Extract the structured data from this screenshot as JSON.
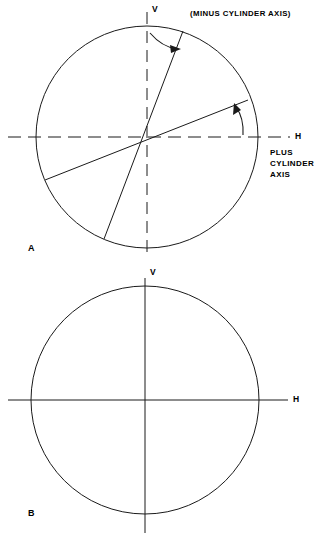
{
  "figure": {
    "stroke_color": "#1a1a1a",
    "background": "#ffffff"
  },
  "panels": [
    {
      "id": "A",
      "letter": "A",
      "center": {
        "x": 147,
        "y": 137
      },
      "radius": 111,
      "axes": {
        "horizontal": {
          "label": "H",
          "style": "dashed"
        },
        "vertical": {
          "label": "V",
          "style": "dashed"
        }
      },
      "annotations": [
        {
          "name": "minus-cylinder-axis-label",
          "text": "(MINUS CYLINDER AXIS)",
          "x": 190,
          "y": 14
        },
        {
          "name": "plus-cylinder-axis-label",
          "lines": [
            "PLUS",
            "CYLINDER",
            "AXIS"
          ],
          "x": 270,
          "y": 152
        }
      ],
      "chords": [
        {
          "name": "minus-cylinder-axis-chord",
          "angle_deg": 72,
          "from": {
            "x": 183,
            "y": 32
          },
          "to": {
            "x": 104,
            "y": 239
          }
        },
        {
          "name": "plus-cylinder-axis-chord",
          "angle_deg": 18,
          "from": {
            "x": 247,
            "y": 100
          },
          "to": {
            "x": 45,
            "y": 180
          }
        }
      ],
      "arrows": [
        {
          "name": "minus-axis-rotation-arrow",
          "direction": "clockwise",
          "near": "vertical-axis"
        },
        {
          "name": "plus-axis-rotation-arrow",
          "direction": "counter-clockwise",
          "near": "horizontal-axis"
        }
      ]
    },
    {
      "id": "B",
      "letter": "B",
      "center": {
        "x": 145,
        "y": 400
      },
      "radius": 114,
      "axes": {
        "horizontal": {
          "label": "H",
          "style": "solid"
        },
        "vertical": {
          "label": "V",
          "style": "solid"
        }
      },
      "annotations": [],
      "chords": [],
      "arrows": []
    }
  ],
  "labels": {
    "h": "H",
    "v": "V",
    "panel_a": "A",
    "panel_b": "B",
    "minus_cylinder_axis": "(MINUS CYLINDER AXIS)",
    "plus_line1": "PLUS",
    "plus_line2": "CYLINDER",
    "plus_line3": "AXIS"
  }
}
